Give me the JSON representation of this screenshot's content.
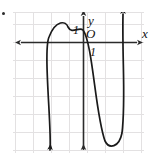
{
  "figure": {
    "kind": "coordinate-grid-graph",
    "width": 158,
    "height": 167,
    "background_color": "#ffffff",
    "grid_color": "#e3e1e2",
    "grid_spacing_px": 18,
    "axis_color": "#2b2b2b",
    "curve_color": "#1a1a1a",
    "bullet_mark": "list-bullet"
  },
  "labels": {
    "y_axis": "y",
    "x_axis": "x",
    "origin": "O",
    "tick_upper": "1",
    "tick_lower": "1"
  },
  "chart_data": {
    "type": "line",
    "title": "",
    "xlabel": "x",
    "ylabel": "y",
    "grid": true,
    "legend": null,
    "axes": {
      "origin_px": [
        70,
        30
      ],
      "unit_px": 18,
      "x_axis_y_px": 30,
      "y_axis_x_px": 70,
      "xlim": [
        -4,
        4
      ],
      "ylim": [
        -6.5,
        1.7
      ]
    },
    "annotations": [
      {
        "text": "y",
        "at_px": [
          88,
          14
        ],
        "italic": true
      },
      {
        "text": "x",
        "at_px": [
          142,
          27
        ],
        "italic": true
      },
      {
        "text": "O",
        "at_px": [
          86,
          27
        ],
        "italic": true
      },
      {
        "text": "1",
        "at_px": [
          73,
          24
        ],
        "italic": true
      },
      {
        "text": "1",
        "at_px": [
          90,
          46
        ],
        "italic": true
      }
    ],
    "series": [
      {
        "name": "curve",
        "description": "polynomial curve: comes up from below-left, local maximum above x-axis near x=-1.2, crosses x-axis at origin, falls steeply to a local minimum near x=2.4, then rises steeply off the top of the plot",
        "arrow_ends": [
          "down-left",
          "up-right"
        ],
        "x": [
          -2.05,
          -1.95,
          -1.8,
          -1.6,
          -1.4,
          -1.2,
          -1.0,
          -0.8,
          -0.6,
          -0.4,
          -0.2,
          0.0,
          0.3,
          0.7,
          1.1,
          1.5,
          1.9,
          2.2,
          2.4,
          2.6,
          2.75,
          2.85,
          2.95
        ],
        "y": [
          -6.4,
          -4.6,
          -2.2,
          -0.3,
          0.6,
          0.95,
          0.9,
          0.72,
          0.55,
          0.38,
          0.2,
          0.0,
          -0.45,
          -1.1,
          -1.9,
          -2.8,
          -4.0,
          -5.1,
          -5.9,
          -6.2,
          -5.4,
          -3.2,
          1.5
        ]
      }
    ],
    "features": {
      "local_maximum_px": [
        62,
        23
      ],
      "x_intercepts_px": [
        57,
        83
      ],
      "local_minimum_px": [
        113,
        145
      ],
      "down_arrow_px": [
        [
          50,
          150
        ],
        [
          83,
          150
        ]
      ],
      "up_arrow_px": [
        [
          123,
          14
        ]
      ],
      "x_axis_arrows_px": [
        [
          15,
          42
        ],
        [
          143,
          42
        ]
      ],
      "y_axis_up_arrow_px": [
        83,
        14
      ]
    }
  }
}
